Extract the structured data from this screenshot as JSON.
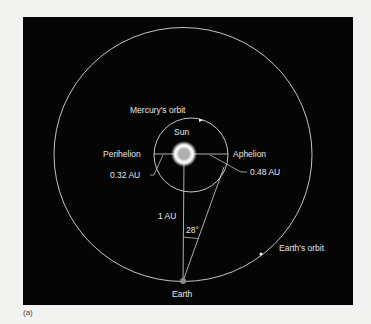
{
  "figure": {
    "caption": "(a)",
    "background": "#050505",
    "line_color": "#d8d8d8",
    "labels": {
      "mercury_orbit": "Mercury's orbit",
      "sun": "Sun",
      "perihelion": "Perihelion",
      "aphelion": "Aphelion",
      "perihelion_distance": "0.32 AU",
      "aphelion_distance": "0.48 AU",
      "earth_sun_distance": "1 AU",
      "angle": "28°",
      "earth_orbit": "Earth's orbit",
      "earth": "Earth"
    }
  }
}
